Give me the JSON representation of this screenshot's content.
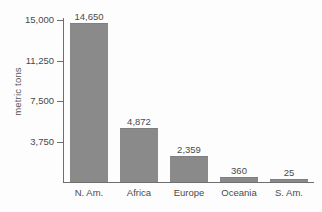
{
  "chart_data": {
    "type": "bar",
    "title": "",
    "xlabel": "",
    "ylabel": "metric tons",
    "categories": [
      "N. Am.",
      "Africa",
      "Europe",
      "Oceania",
      "S. Am."
    ],
    "values": [
      14650,
      4872,
      2359,
      360,
      25
    ],
    "value_labels": [
      "14,650",
      "4,872",
      "2,359",
      "360",
      "25"
    ],
    "ylim": [
      0,
      15000
    ],
    "ytick_values": [
      3750,
      7500,
      11250,
      15000
    ],
    "ytick_labels": [
      "3,750",
      "7,500",
      "11,250",
      "15,000"
    ],
    "grid": false,
    "legend": null,
    "colors": {
      "bar_fill": "#8a8a8a",
      "axis": "#6e6e6e",
      "text": "#4a4a4a",
      "background": "#fdfdfd"
    }
  }
}
